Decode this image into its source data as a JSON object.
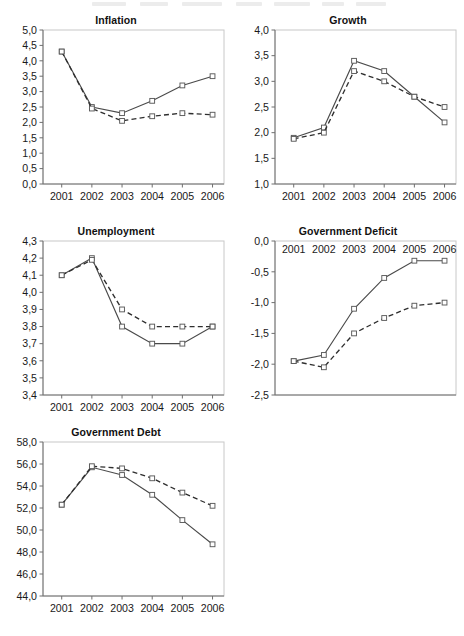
{
  "figure": {
    "background": "#ffffff",
    "series_styles": {
      "solid_color": "#4a4a4a",
      "dashed_color": "#2e2e2e",
      "marker": "open-square"
    }
  },
  "chart_data": [
    {
      "type": "line",
      "title": "Inflation",
      "xlabel": "",
      "ylabel": "",
      "x": [
        "2001",
        "2002",
        "2003",
        "2004",
        "2005",
        "2006"
      ],
      "ylim": [
        0.0,
        5.0
      ],
      "yticks": [
        "0,0",
        "0,5",
        "1,0",
        "1,5",
        "2,0",
        "2,5",
        "3,0",
        "3,5",
        "4,0",
        "4,5",
        "5,0"
      ],
      "ytick_values": [
        0.0,
        0.5,
        1.0,
        1.5,
        2.0,
        2.5,
        3.0,
        3.5,
        4.0,
        4.5,
        5.0
      ],
      "grid": false,
      "legend": "none",
      "xaxis_position": "bottom",
      "series": [
        {
          "name": "solid",
          "style": "solid",
          "values": [
            4.3,
            2.5,
            2.3,
            2.7,
            3.2,
            3.5
          ]
        },
        {
          "name": "dashed",
          "style": "dashed",
          "values": [
            4.3,
            2.45,
            2.05,
            2.2,
            2.3,
            2.25
          ]
        }
      ]
    },
    {
      "type": "line",
      "title": "Growth",
      "xlabel": "",
      "ylabel": "",
      "x": [
        "2001",
        "2002",
        "2003",
        "2004",
        "2005",
        "2006"
      ],
      "ylim": [
        1.0,
        4.0
      ],
      "yticks": [
        "1,0",
        "1,5",
        "2,0",
        "2,5",
        "3,0",
        "3,5",
        "4,0"
      ],
      "ytick_values": [
        1.0,
        1.5,
        2.0,
        2.5,
        3.0,
        3.5,
        4.0
      ],
      "grid": false,
      "legend": "none",
      "xaxis_position": "bottom",
      "series": [
        {
          "name": "solid",
          "style": "solid",
          "values": [
            1.9,
            2.1,
            3.4,
            3.2,
            2.7,
            2.2
          ]
        },
        {
          "name": "dashed",
          "style": "dashed",
          "values": [
            1.88,
            2.0,
            3.2,
            3.0,
            2.7,
            2.5
          ]
        }
      ]
    },
    {
      "type": "line",
      "title": "Unemployment",
      "xlabel": "",
      "ylabel": "",
      "x": [
        "2001",
        "2002",
        "2003",
        "2004",
        "2005",
        "2006"
      ],
      "ylim": [
        3.4,
        4.3
      ],
      "yticks": [
        "3,4",
        "3,5",
        "3,6",
        "3,7",
        "3,8",
        "3,9",
        "4,0",
        "4,1",
        "4,2",
        "4,3"
      ],
      "ytick_values": [
        3.4,
        3.5,
        3.6,
        3.7,
        3.8,
        3.9,
        4.0,
        4.1,
        4.2,
        4.3
      ],
      "grid": false,
      "legend": "none",
      "xaxis_position": "bottom",
      "series": [
        {
          "name": "solid",
          "style": "solid",
          "values": [
            4.1,
            4.2,
            3.8,
            3.7,
            3.7,
            3.8
          ]
        },
        {
          "name": "dashed",
          "style": "dashed",
          "values": [
            4.1,
            4.19,
            3.9,
            3.8,
            3.8,
            3.8
          ]
        }
      ]
    },
    {
      "type": "line",
      "title": "Government Deficit",
      "xlabel": "",
      "ylabel": "",
      "x": [
        "2001",
        "2002",
        "2003",
        "2004",
        "2005",
        "2006"
      ],
      "ylim": [
        -2.5,
        0.0
      ],
      "yticks": [
        "0,0",
        "-0,5",
        "-1,0",
        "-1,5",
        "-2,0",
        "-2,5"
      ],
      "ytick_values": [
        0.0,
        -0.5,
        -1.0,
        -1.5,
        -2.0,
        -2.5
      ],
      "grid": false,
      "legend": "none",
      "xaxis_position": "top",
      "series": [
        {
          "name": "solid",
          "style": "solid",
          "values": [
            -1.95,
            -1.85,
            -1.1,
            -0.6,
            -0.32,
            -0.32
          ]
        },
        {
          "name": "dashed",
          "style": "dashed",
          "values": [
            -1.95,
            -2.05,
            -1.5,
            -1.25,
            -1.05,
            -1.0
          ]
        }
      ]
    },
    {
      "type": "line",
      "title": "Government Debt",
      "xlabel": "",
      "ylabel": "",
      "x": [
        "2001",
        "2002",
        "2003",
        "2004",
        "2005",
        "2006"
      ],
      "ylim": [
        44.0,
        58.0
      ],
      "yticks": [
        "44,0",
        "46,0",
        "48,0",
        "50,0",
        "52,0",
        "54,0",
        "56,0",
        "58,0"
      ],
      "ytick_values": [
        44.0,
        46.0,
        48.0,
        50.0,
        52.0,
        54.0,
        56.0,
        58.0
      ],
      "grid": false,
      "legend": "none",
      "xaxis_position": "bottom",
      "series": [
        {
          "name": "solid",
          "style": "solid",
          "values": [
            52.3,
            55.7,
            55.0,
            53.2,
            50.9,
            48.7
          ]
        },
        {
          "name": "dashed",
          "style": "dashed",
          "values": [
            52.3,
            55.8,
            55.6,
            54.7,
            53.4,
            52.2
          ]
        }
      ]
    }
  ]
}
